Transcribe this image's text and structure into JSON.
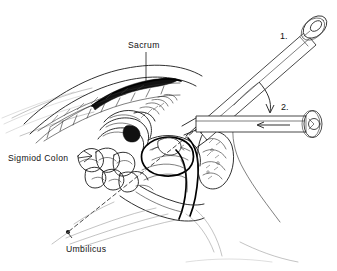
{
  "figure": {
    "type": "line-drawing-medical-illustration",
    "background_color": "#ffffff",
    "ink_color": "#111111",
    "width": 337,
    "height": 271
  },
  "labels": {
    "sacrum": "Sacrum",
    "sigmoid_colon": "Sigmiod  Colon",
    "umbilicus": "Umbilicus"
  },
  "callouts": {
    "position_one": "1.",
    "position_two": "2."
  },
  "annotations": {
    "rotation_arrow": "curved-arrow-from-position-1-to-position-2",
    "aspiration_arrow": "leftward-arrow-inside-horizontal-syringe-barrel",
    "trajectory": "dashed-line-from-insertion-point-to-umbilicus",
    "umbilicus_marker": "filled-dot"
  },
  "structures": [
    "vertebral-column",
    "sacrum",
    "sigmoid-colon",
    "small-intestine-coils",
    "bladder",
    "rectum",
    "pubic-bone",
    "abdominal-wall",
    "syringe-position-1",
    "syringe-position-2"
  ]
}
